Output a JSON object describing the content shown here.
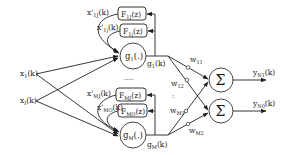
{
  "diagram": {
    "inputs": [
      {
        "base": "x",
        "sub": "1",
        "arg": "(k)"
      },
      {
        "base": "x",
        "sub": "I",
        "arg": "(k)"
      }
    ],
    "hidden_nodes": [
      {
        "base": "g",
        "sub": "1",
        "arg": "(.)",
        "output_base": "g",
        "output_sub": "1",
        "output_arg": "(k)"
      },
      {
        "base": "g",
        "sub": "M",
        "arg": "(.)",
        "output_base": "g",
        "output_sub": "M",
        "output_arg": "(k)"
      }
    ],
    "filters": [
      {
        "base": "F",
        "sub": "1J",
        "arg": "(z)",
        "feedback_base": "x'",
        "feedback_sub": "1J",
        "feedback_arg": "(k)"
      },
      {
        "base": "F",
        "sub": "1j",
        "arg": "(z)",
        "feedback_base": "x'",
        "feedback_sub": "1j",
        "feedback_arg": "(k)"
      },
      {
        "base": "F",
        "sub": "MJ",
        "arg": "(z)",
        "feedback_base": "x'",
        "feedback_sub": "MJ",
        "feedback_arg": "(k)"
      },
      {
        "base": "F",
        "sub": "MO",
        "arg": "(z)",
        "feedback_base": "x'",
        "feedback_sub": "MO",
        "feedback_arg": "(k)"
      }
    ],
    "weights": [
      {
        "base": "w",
        "sub": "11"
      },
      {
        "base": "w",
        "sub": "12"
      },
      {
        "base": "w",
        "sub": "M1"
      },
      {
        "base": "w",
        "sub": "M2"
      }
    ],
    "ellipsis_nodes": "....",
    "ellipsis_weights": ":",
    "summers": [
      {
        "symbol": "Σ",
        "output_base": "y",
        "output_sub": "N1",
        "output_arg": "(k)"
      },
      {
        "symbol": "Σ",
        "output_base": "y",
        "output_sub": "N0",
        "output_arg": "(k)"
      }
    ]
  }
}
